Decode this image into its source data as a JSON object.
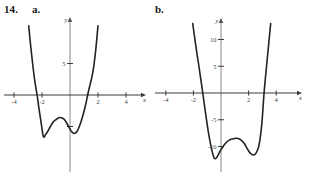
{
  "exercise": {
    "number": "14.",
    "parts": [
      {
        "key": "a",
        "label": "a."
      },
      {
        "key": "b",
        "label": "b."
      }
    ]
  },
  "colors": {
    "curve": "#222222",
    "axis_x": "#3a3a3a",
    "axis_y": "#888888",
    "text": "#1a1a1a",
    "background": "#ffffff"
  },
  "chart_data": [
    {
      "id": "graph-a",
      "type": "line",
      "title": "",
      "xlabel": "x",
      "ylabel": "y",
      "xlim": [
        -4.9,
        5.0
      ],
      "ylim": [
        -9.5,
        11.0
      ],
      "grid": false,
      "legend": "none",
      "xticks": [
        -4,
        -2,
        2,
        4
      ],
      "xticklabels": [
        "-4",
        "-2",
        "2",
        "4"
      ],
      "yticks": [
        5
      ],
      "yticklabels": [
        "5"
      ],
      "y_unlabeled_ticks": [
        -5
      ],
      "description": "Quartic polynomial with W shape, two local minima below the x-axis and a local maximum between them; x-intercepts near -2.3 and 1.6",
      "features": {
        "local_min_left": {
          "x": -1.9,
          "y": -6.6
        },
        "local_max_middle": {
          "x": -0.55,
          "y": -3.6
        },
        "local_min_right": {
          "x": 0.32,
          "y": -6.1
        },
        "x_intercepts": [
          -2.35,
          1.58
        ]
      },
      "series": [
        {
          "name": "f(x)",
          "x": [
            -2.95,
            -2.8,
            -2.65,
            -2.5,
            -2.35,
            -2.2,
            -2.05,
            -1.9,
            -1.75,
            -1.6,
            -1.4,
            -1.2,
            -1.0,
            -0.8,
            -0.6,
            -0.4,
            -0.2,
            0.0,
            0.15,
            0.32,
            0.5,
            0.7,
            0.9,
            1.1,
            1.3,
            1.45,
            1.58,
            1.7,
            1.85,
            2.0
          ],
          "y": [
            11.0,
            7.6,
            4.6,
            2.0,
            0.0,
            -2.4,
            -4.6,
            -6.6,
            -6.3,
            -5.8,
            -5.0,
            -4.3,
            -3.9,
            -3.6,
            -3.6,
            -3.9,
            -4.6,
            -5.4,
            -5.9,
            -6.1,
            -5.8,
            -4.8,
            -3.4,
            -1.7,
            0.4,
            1.8,
            3.0,
            4.6,
            7.4,
            11.0
          ]
        }
      ]
    },
    {
      "id": "graph-b",
      "type": "line",
      "title": "",
      "xlabel": "x",
      "ylabel": "y",
      "xlim": [
        -5.0,
        5.0
      ],
      "ylim": [
        -13.5,
        13.0
      ],
      "grid": false,
      "legend": "none",
      "xticks": [
        -4,
        -2,
        2,
        4
      ],
      "xticklabels": [
        "-4",
        "-2",
        "2",
        "4"
      ],
      "yticks": [
        10,
        5,
        -5,
        -10
      ],
      "yticklabels": [
        "10",
        "5",
        "-5",
        "-10"
      ],
      "description": "Quartic polynomial with W shape, two deep local minima near y = -12 and a local maximum near y = -8.5; x-intercepts near -1.3 and 3.1",
      "features": {
        "local_min_left": {
          "x": -0.45,
          "y": -12.3
        },
        "local_max_middle": {
          "x": 1.25,
          "y": -8.5
        },
        "local_min_right": {
          "x": 2.35,
          "y": -11.6
        },
        "x_intercepts": [
          -1.32,
          3.12
        ]
      },
      "series": [
        {
          "name": "g(x)",
          "x": [
            -2.05,
            -1.9,
            -1.75,
            -1.6,
            -1.45,
            -1.32,
            -1.15,
            -1.0,
            -0.85,
            -0.7,
            -0.55,
            -0.45,
            -0.3,
            -0.15,
            0.0,
            0.2,
            0.4,
            0.6,
            0.8,
            1.0,
            1.25,
            1.5,
            1.7,
            1.9,
            2.1,
            2.35,
            2.55,
            2.75,
            2.95,
            3.12,
            3.3,
            3.45,
            3.6
          ],
          "y": [
            13.0,
            10.2,
            7.5,
            5.0,
            2.3,
            0.0,
            -3.2,
            -5.9,
            -8.3,
            -10.3,
            -11.8,
            -12.3,
            -12.0,
            -11.3,
            -10.6,
            -9.8,
            -9.2,
            -8.8,
            -8.6,
            -8.5,
            -8.5,
            -8.9,
            -9.5,
            -10.4,
            -11.2,
            -11.6,
            -11.2,
            -9.8,
            -6.0,
            0.0,
            5.0,
            9.0,
            13.0
          ]
        }
      ]
    }
  ]
}
